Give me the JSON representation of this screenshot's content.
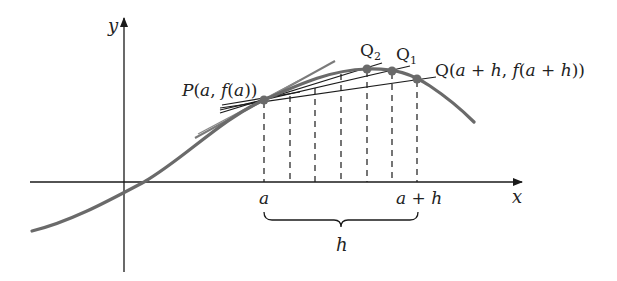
{
  "diagram": {
    "colors": {
      "curve": "#6a6a6a",
      "tangent": "#7a7a7a",
      "secant": "#1c1c1c",
      "axis": "#1a1a1a",
      "point": "#6a6a6a",
      "text": "#222222"
    },
    "axes": {
      "x_label": "x",
      "y_label": "y"
    },
    "labels": {
      "point_p": "P(a, f(a))",
      "point_q": "Q(a + h, f(a + h))",
      "point_q1_main": "Q",
      "point_q1_sub": "1",
      "point_q2_main": "Q",
      "point_q2_sub": "2",
      "tick_a": "a",
      "tick_a_plus_h": "a + h",
      "brace_h": "h"
    },
    "points": [
      {
        "name": "P",
        "x": 264,
        "y": 100
      },
      {
        "name": "Q2",
        "x": 367,
        "y": 69
      },
      {
        "name": "Q1",
        "x": 392,
        "y": 71
      },
      {
        "name": "Q",
        "x": 417,
        "y": 79
      }
    ],
    "dashed_guides_x": [
      264,
      290,
      315,
      341,
      367,
      392,
      417
    ]
  }
}
